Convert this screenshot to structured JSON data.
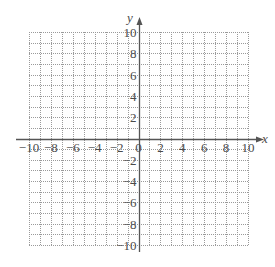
{
  "chart_data": {
    "type": "scatter",
    "title": "",
    "xlabel": "x",
    "ylabel": "y",
    "xlim": [
      -10,
      10
    ],
    "ylim": [
      -10,
      10
    ],
    "grid": true,
    "grid_style": "dotted",
    "grid_step": 1,
    "x_ticks": [
      -10,
      -8,
      -6,
      -4,
      -2,
      0,
      2,
      4,
      6,
      8,
      10
    ],
    "x_tick_labels": [
      "−10",
      "−8",
      "−6",
      "−4",
      "−2",
      "0",
      "2",
      "4",
      "6",
      "8",
      "10"
    ],
    "y_ticks": [
      -10,
      -8,
      -6,
      -4,
      -2,
      2,
      4,
      6,
      8,
      10
    ],
    "y_tick_labels": [
      "−10",
      "−8",
      "−6",
      "−4",
      "−2",
      "2",
      "4",
      "6",
      "8",
      "10"
    ],
    "series": [],
    "legend": null
  },
  "axes": {
    "x_label": "x",
    "y_label": "y"
  },
  "colors": {
    "grid": "#9a9a9a",
    "axis": "#555555",
    "text": "#4a4a4a"
  }
}
